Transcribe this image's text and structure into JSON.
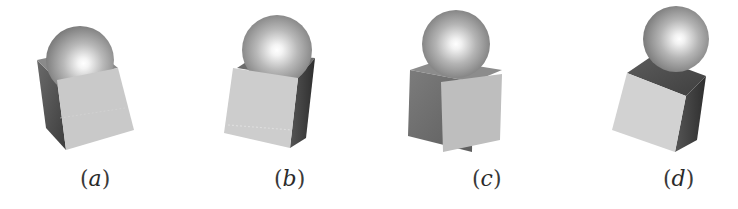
{
  "figure": {
    "panels": [
      {
        "id": "a",
        "caption_open": "(",
        "caption_letter": "a",
        "caption_close": ")",
        "description": "Sphere resting on cube rotated with front face tilted right"
      },
      {
        "id": "b",
        "caption_open": "(",
        "caption_letter": "b",
        "caption_close": ")",
        "description": "Sphere resting on cube with front face tilted left, dark right face"
      },
      {
        "id": "c",
        "caption_open": "(",
        "caption_letter": "c",
        "caption_close": ")",
        "description": "Sphere resting on upright cube, dark left face"
      },
      {
        "id": "d",
        "caption_open": "(",
        "caption_letter": "d",
        "caption_close": ")",
        "description": "Sphere resting on cube tilted left, dark top and right faces"
      }
    ],
    "colors": {
      "background": "#ffffff",
      "cube_light_face": "#cfcfcf",
      "cube_mid_face": "#9a9a9a",
      "cube_dark_face": "#4a4a4a",
      "sphere_highlight": "#ffffff",
      "sphere_shadow": "#5a5a5a",
      "caption_text": "#2a2a2a"
    }
  }
}
